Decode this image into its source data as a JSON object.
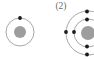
{
  "figure": {
    "background_color": "#ffffff",
    "palette": {
      "shell_stroke": "#9d9d9d",
      "nucleus_fill": "#9d9d9d",
      "electron_fill": "#1a1a1a",
      "label_color": "#6d6d6d"
    },
    "atoms": [
      {
        "name": "atom-left",
        "label": "",
        "center": {
          "x": 20,
          "y": 32
        },
        "nucleus_radius": 6,
        "shells": [
          {
            "name": "shell-1",
            "radius": 14,
            "electron_count": 1,
            "electrons": [
              {
                "x": 20,
                "y": 18
              }
            ]
          }
        ]
      },
      {
        "name": "atom-right",
        "label": "(2)",
        "label_position": {
          "x": 61,
          "y": 9
        },
        "center": {
          "x": 88,
          "y": 33
        },
        "nucleus_radius": 7,
        "shells": [
          {
            "name": "shell-1",
            "radius": 14,
            "electron_count": 3,
            "electrons": [
              {
                "x": 87,
                "y": 19
              },
              {
                "x": 87,
                "y": 47
              },
              {
                "x": 74,
                "y": 32
              }
            ]
          },
          {
            "name": "shell-2",
            "radius": 22,
            "electron_count": 3,
            "electrons": [
              {
                "x": 87,
                "y": 11
              },
              {
                "x": 87,
                "y": 55
              },
              {
                "x": 66,
                "y": 32
              }
            ]
          }
        ]
      }
    ]
  }
}
